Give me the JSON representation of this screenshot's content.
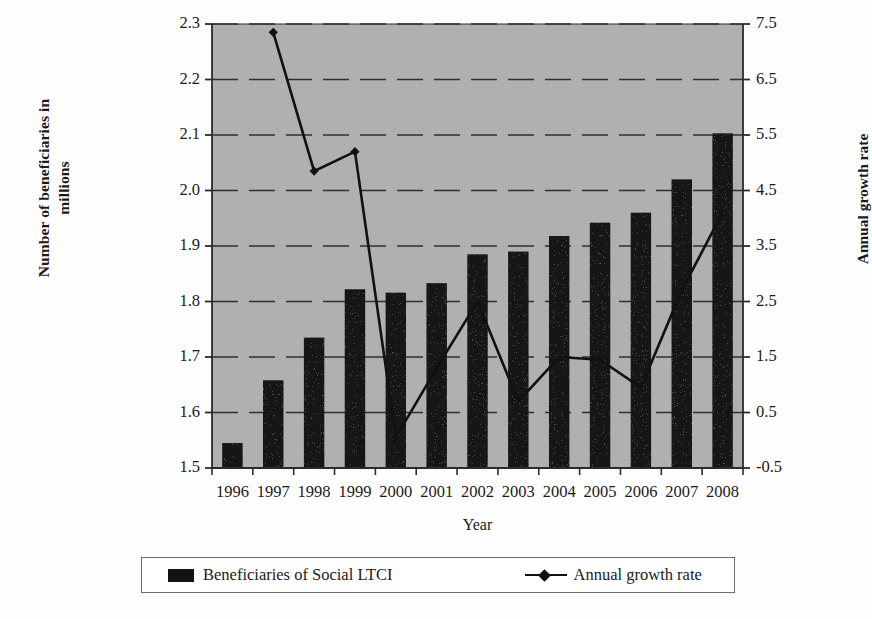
{
  "chart_data": {
    "type": "bar",
    "title": "",
    "xlabel": "Year",
    "ylabel": "Number of beneficiaries in millions",
    "ylabel_secondary": "Annual growth rate",
    "categories": [
      "1996",
      "1997",
      "1998",
      "1999",
      "2000",
      "2001",
      "2002",
      "2003",
      "2004",
      "2005",
      "2006",
      "2007",
      "2008"
    ],
    "ylim": [
      1.5,
      2.3
    ],
    "ylim_secondary": [
      -0.5,
      7.5
    ],
    "yticks": [
      "1.5",
      "1.6",
      "1.7",
      "1.8",
      "1.9",
      "2.0",
      "2.1",
      "2.2",
      "2.3"
    ],
    "yticks_secondary": [
      "-0.5",
      "0.5",
      "1.5",
      "2.5",
      "3.5",
      "4.5",
      "5.5",
      "6.5",
      "7.5"
    ],
    "grid": true,
    "legend_position": "bottom",
    "plot_background": "#b0b0b0",
    "series": [
      {
        "name": "Beneficiaries of Social LTCI",
        "kind": "bar",
        "axis": "left",
        "color": "#131313",
        "values": [
          1.545,
          1.658,
          1.735,
          1.822,
          1.816,
          1.833,
          1.885,
          1.89,
          1.918,
          1.942,
          1.96,
          2.02,
          2.103
        ]
      },
      {
        "name": "Annual growth rate",
        "kind": "line",
        "axis": "right",
        "color": "#111111",
        "marker": "diamond",
        "values": [
          null,
          7.35,
          4.85,
          5.2,
          0.05,
          1.3,
          2.5,
          0.7,
          1.5,
          1.45,
          0.95,
          2.7,
          4.1
        ]
      }
    ]
  },
  "axes": {
    "left_title_line1": "Number of beneficiaries in",
    "left_title_line2": "millions",
    "right_title": "Annual growth rate",
    "x_title": "Year"
  },
  "legend": {
    "bar_label": "Beneficiaries of Social LTCI",
    "line_label": "Annual growth rate"
  },
  "colors": {
    "plot_bg": "#b0b0b0",
    "bar": "#131313",
    "line": "#111111",
    "axis": "#2b2b2b",
    "grid": "#2f2f2f",
    "page_bg": "#fefefe"
  }
}
